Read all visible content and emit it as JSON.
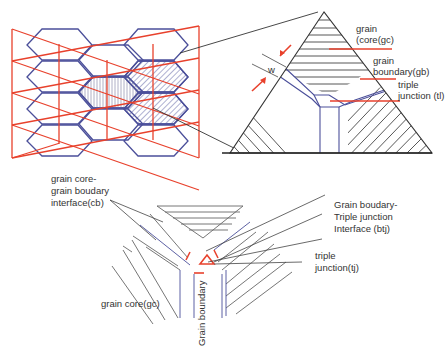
{
  "colors": {
    "red": "#e8412c",
    "blue": "#4b4f9a",
    "black": "#333333",
    "gray": "#666666"
  },
  "top_right": {
    "w_label": "w",
    "gc_label_1": "grain",
    "gc_label_2": "(core(gc)",
    "gb_label_1": "grain",
    "gb_label_2": "boundary(gb)",
    "tj_label_1": "triple",
    "tj_label_2": "junction (tl)"
  },
  "bottom": {
    "cb_label_1": "grain core-",
    "cb_label_2": "grain boudary",
    "cb_label_3": "interface(cb)",
    "btj_label_1": "Grain boudary-",
    "btj_label_2": "Triple junction",
    "btj_label_3": "Interface (btj)",
    "tj_label_1": "triple",
    "tj_label_2": "junction(tj)",
    "gc_label": "grain core(gc)",
    "gb_label": "Grain boundary"
  }
}
